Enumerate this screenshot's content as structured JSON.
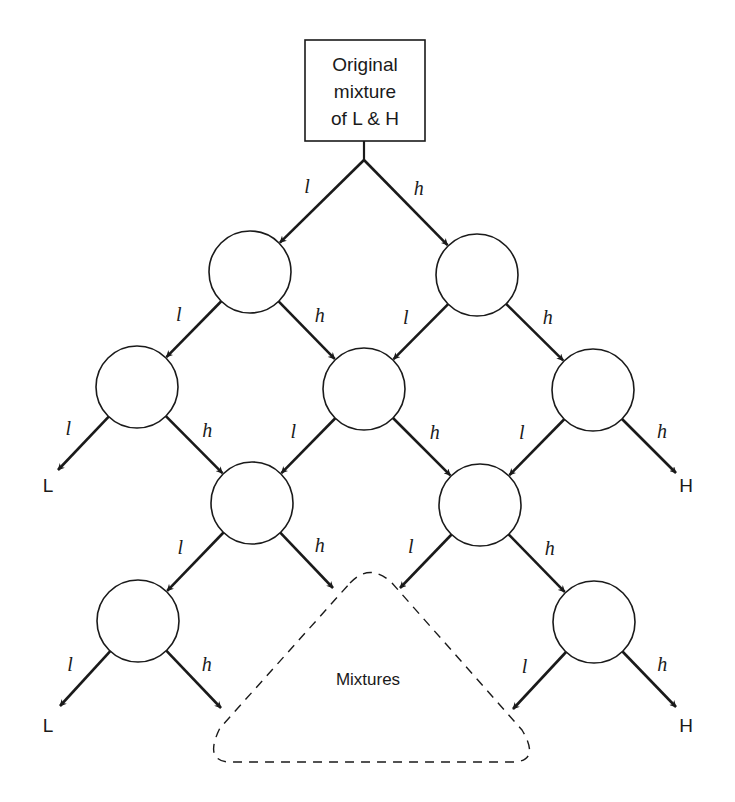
{
  "diagram": {
    "type": "separation-cascade",
    "start_box": {
      "lines": [
        "Original",
        "mixture",
        "of L & H"
      ]
    },
    "edge_labels": {
      "light": "l",
      "heavy": "h"
    },
    "end_labels": {
      "light": "L",
      "heavy": "H"
    },
    "mixtures_label": "Mixtures",
    "colors": {
      "ink": "#1a1a1a",
      "background": "#ffffff"
    },
    "nodes": [
      {
        "id": "n1a",
        "level": 1,
        "position": "left"
      },
      {
        "id": "n1b",
        "level": 1,
        "position": "right"
      },
      {
        "id": "n2a",
        "level": 2,
        "position": "left"
      },
      {
        "id": "n2b",
        "level": 2,
        "position": "middle"
      },
      {
        "id": "n2c",
        "level": 2,
        "position": "right"
      },
      {
        "id": "n3a",
        "level": 3,
        "position": "left"
      },
      {
        "id": "n3b",
        "level": 3,
        "position": "right"
      },
      {
        "id": "n4a",
        "level": 4,
        "position": "left"
      },
      {
        "id": "n4b",
        "level": 4,
        "position": "right"
      }
    ],
    "edges": [
      {
        "from": "start",
        "to": "n1a",
        "label": "l"
      },
      {
        "from": "start",
        "to": "n1b",
        "label": "h"
      },
      {
        "from": "n1a",
        "to": "n2a",
        "label": "l"
      },
      {
        "from": "n1a",
        "to": "n2b",
        "label": "h"
      },
      {
        "from": "n1b",
        "to": "n2b",
        "label": "l"
      },
      {
        "from": "n1b",
        "to": "n2c",
        "label": "h"
      },
      {
        "from": "n2a",
        "to": "L",
        "label": "l"
      },
      {
        "from": "n2a",
        "to": "n3a",
        "label": "h"
      },
      {
        "from": "n2b",
        "to": "n3a",
        "label": "l"
      },
      {
        "from": "n2b",
        "to": "n3b",
        "label": "h"
      },
      {
        "from": "n2c",
        "to": "n3b",
        "label": "l"
      },
      {
        "from": "n2c",
        "to": "H",
        "label": "h"
      },
      {
        "from": "n3a",
        "to": "n4a",
        "label": "l"
      },
      {
        "from": "n3a",
        "to": "mixtures",
        "label": "h"
      },
      {
        "from": "n3b",
        "to": "mixtures",
        "label": "l"
      },
      {
        "from": "n3b",
        "to": "n4b",
        "label": "h"
      },
      {
        "from": "n4a",
        "to": "L",
        "label": "l"
      },
      {
        "from": "n4a",
        "to": "mixtures",
        "label": "h"
      },
      {
        "from": "n4b",
        "to": "mixtures",
        "label": "l"
      },
      {
        "from": "n4b",
        "to": "H",
        "label": "h"
      }
    ]
  }
}
